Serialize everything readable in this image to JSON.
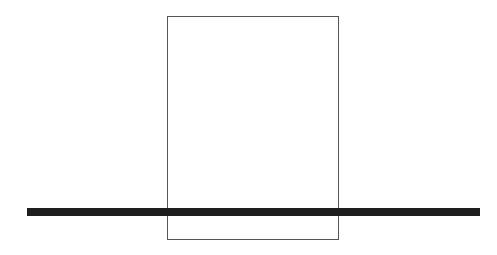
{
  "diagram": {
    "shapes": [
      {
        "type": "rectangle",
        "x": 167,
        "y": 16,
        "width": 172,
        "height": 224,
        "stroke": "#555555",
        "fill": "none"
      },
      {
        "type": "thick-line",
        "x1": 27,
        "y1": 212,
        "x2": 480,
        "y2": 212,
        "thickness": 8,
        "color": "#1e1e1e"
      }
    ]
  }
}
